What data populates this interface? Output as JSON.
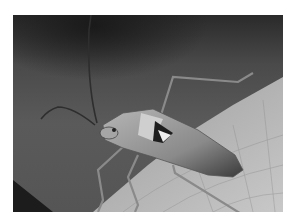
{
  "image": {
    "subject": "insect on a leaf",
    "description": "Grayscale macro photograph of a long-legged bug with long antennae standing on a veined leaf against a dark blurred background",
    "colors": {
      "background_dark": "#2a2a2a",
      "background_mid": "#5a5a5a",
      "leaf": "#b8b8b8",
      "insect_body": "#9a9a9a",
      "border": "#ffffff"
    }
  }
}
